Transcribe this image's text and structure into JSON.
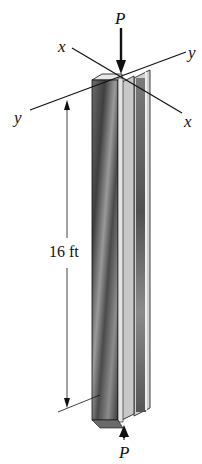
{
  "diagram": {
    "labels": {
      "load_top": "P",
      "load_bottom": "P",
      "axis_x_left": "x",
      "axis_x_right": "x",
      "axis_y_left": "y",
      "axis_y_right": "y",
      "length": "16 ft"
    },
    "colors": {
      "line": "#111111",
      "flange_dark": "#5a5a5a",
      "flange_mid": "#8a8a8a",
      "flange_light": "#d8d8d8",
      "edge_light": "#e6e6e6"
    }
  }
}
